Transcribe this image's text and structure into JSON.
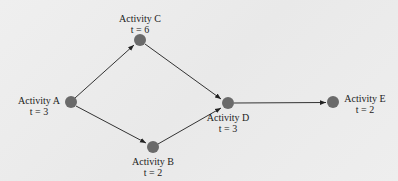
{
  "diagram": {
    "type": "activity-network",
    "background": "#ededed",
    "node_color": "#6a6a6a",
    "edge_color": "#333333",
    "nodes": [
      {
        "id": "A",
        "name": "Activity A",
        "time": "t = 3"
      },
      {
        "id": "B",
        "name": "Activity B",
        "time": "t = 2"
      },
      {
        "id": "C",
        "name": "Activity C",
        "time": "t = 6"
      },
      {
        "id": "D",
        "name": "Activity D",
        "time": "t = 3"
      },
      {
        "id": "E",
        "name": "Activity E",
        "time": "t = 2"
      }
    ],
    "edges": [
      {
        "from": "A",
        "to": "C"
      },
      {
        "from": "A",
        "to": "B"
      },
      {
        "from": "C",
        "to": "D"
      },
      {
        "from": "B",
        "to": "D"
      },
      {
        "from": "D",
        "to": "E"
      }
    ]
  }
}
